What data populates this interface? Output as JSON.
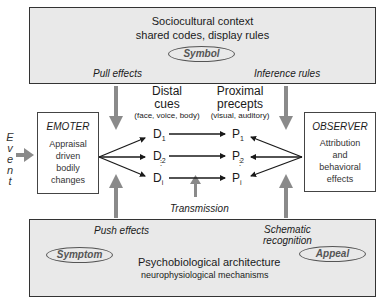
{
  "top_panel": {
    "title": "Sociocultural context",
    "subtitle": "shared codes, display rules",
    "oval_label": "Symbol",
    "left_label": "Pull effects",
    "right_label": "Inference rules"
  },
  "bottom_panel": {
    "title": "Psychobiological architecture",
    "subtitle": "neurophysiological mechanisms",
    "left_oval_label": "Symptom",
    "right_oval_label": "Appeal",
    "left_label": "Push effects",
    "right_label_line1": "Schematic",
    "right_label_line2": "recognition"
  },
  "event": {
    "letters": [
      "E",
      "v",
      "e",
      "n",
      "t"
    ]
  },
  "emoter": {
    "title": "EMOTER",
    "lines": [
      "Appraisal",
      "driven",
      "bodily",
      "changes"
    ]
  },
  "observer": {
    "title": "OBSERVER",
    "lines": [
      "Attribution",
      "and",
      "behavioral",
      "effects"
    ]
  },
  "distal": {
    "line1": "Distal",
    "line2": "cues",
    "line3": "(face, voice, body)",
    "cues": [
      {
        "letter": "D",
        "sub": "1"
      },
      {
        "letter": "D",
        "sub": "2"
      },
      {
        "letter": "D",
        "sub": "i"
      }
    ]
  },
  "proximal": {
    "line1": "Proximal",
    "line2": "precepts",
    "line3": "(visual, auditory)",
    "percepts": [
      {
        "letter": "P",
        "sub": "1"
      },
      {
        "letter": "P",
        "sub": "2"
      },
      {
        "letter": "P",
        "sub": "i"
      }
    ]
  },
  "transmission_label": "Transmission",
  "colors": {
    "panel_bg": "#e9e9e9",
    "arrow_gray": "#8a8a8a",
    "line_dark": "#1a1a1a",
    "oval_text": "#555555"
  }
}
